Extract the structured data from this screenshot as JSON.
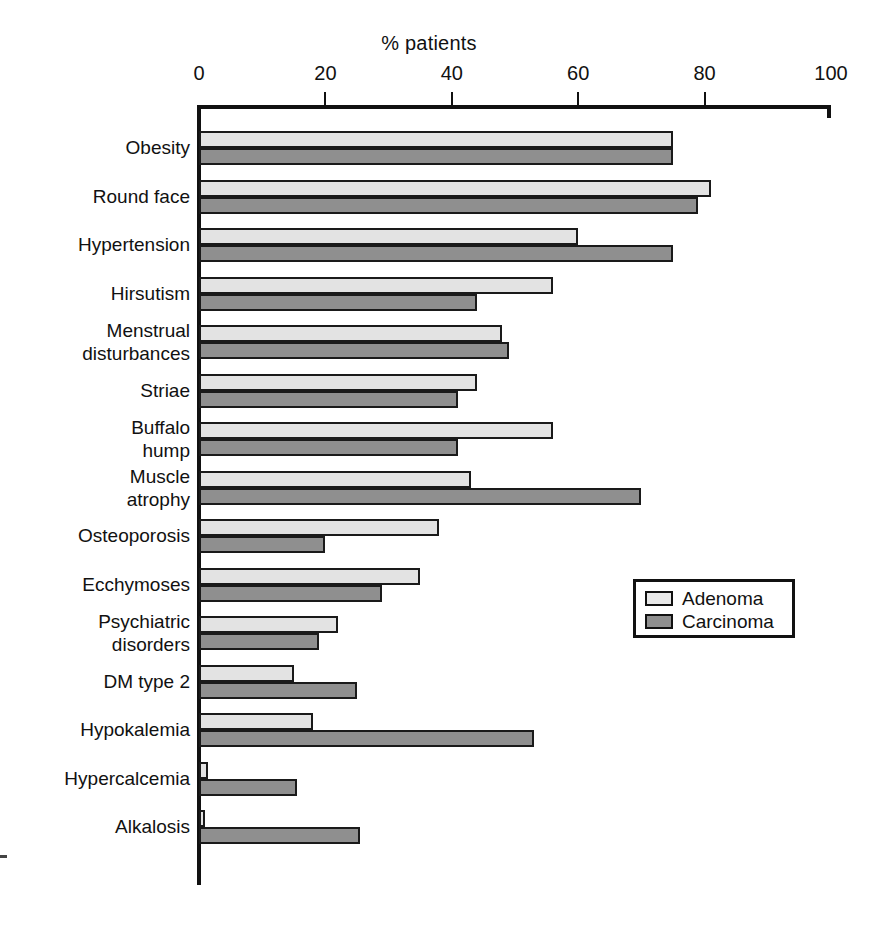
{
  "chart_data": {
    "type": "bar",
    "orientation": "horizontal",
    "title": "% patients",
    "xlabel": "% patients",
    "ylabel": "",
    "xlim": [
      0,
      100
    ],
    "xticks": [
      0,
      20,
      40,
      60,
      80,
      100
    ],
    "xticklabels": [
      "0",
      "20",
      "40",
      "60",
      "80",
      "100"
    ],
    "grid": false,
    "legend_position": "middle-right",
    "categories": [
      "Obesity",
      "Round face",
      "Hypertension",
      "Hirsutism",
      "Menstrual\ndisturbances",
      "Striae",
      "Buffalo\nhump",
      "Muscle\natrophy",
      "Osteoporosis",
      "Ecchymoses",
      "Psychiatric\ndisorders",
      "DM type 2",
      "Hypokalemia",
      "Hypercalcemia",
      "Alkalosis"
    ],
    "series": [
      {
        "name": "Adenoma",
        "color": "#e3e3e3",
        "values": [
          75,
          81,
          60,
          56,
          48,
          44,
          56,
          43,
          38,
          35,
          22,
          15,
          18,
          1.5,
          1
        ]
      },
      {
        "name": "Carcinoma",
        "color": "#8f8f8f",
        "values": [
          75,
          79,
          75,
          44,
          49,
          41,
          41,
          70,
          20,
          29,
          19,
          25,
          53,
          15.5,
          25.5
        ]
      }
    ]
  },
  "legend": {
    "items": [
      {
        "label": "Adenoma",
        "swatch": "adenoma"
      },
      {
        "label": "Carcinoma",
        "swatch": "carcinoma"
      }
    ]
  }
}
